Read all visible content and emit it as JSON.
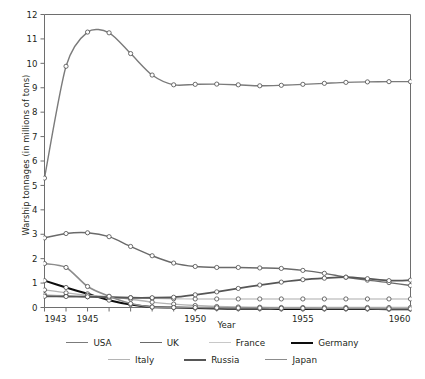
{
  "chart_data": {
    "type": "line",
    "title": "",
    "xlabel": "Year",
    "ylabel": "Warship tonnages (in millions of tons)",
    "xlim": [
      1943,
      1960
    ],
    "ylim": [
      0,
      12
    ],
    "ytick_step": 1,
    "yticks": [
      "0",
      "1",
      "2",
      "3",
      "4",
      "5",
      "6",
      "7",
      "8",
      "9",
      "10",
      "11",
      "12"
    ],
    "xticks_major": [
      "1943",
      "1945",
      "1950",
      "1955",
      "1960"
    ],
    "xticks_all": [
      1943,
      1944,
      1945,
      1946,
      1947,
      1948,
      1949,
      1950,
      1951,
      1952,
      1953,
      1954,
      1955,
      1956,
      1957,
      1958,
      1959,
      1960
    ],
    "grid": false,
    "marker": "open-circle",
    "legend_position": "bottom",
    "x": [
      1943,
      1944,
      1945,
      1946,
      1947,
      1948,
      1949,
      1950,
      1951,
      1952,
      1953,
      1954,
      1955,
      1956,
      1957,
      1958,
      1959,
      1960
    ],
    "series": [
      {
        "name": "USA",
        "color": "#7b7b7b",
        "width": 1.4,
        "values": [
          5.3,
          9.88,
          11.28,
          11.25,
          10.4,
          9.52,
          9.12,
          9.14,
          9.15,
          9.12,
          9.08,
          9.1,
          9.14,
          9.18,
          9.22,
          9.24,
          9.25,
          9.25
        ]
      },
      {
        "name": "UK",
        "color": "#6a6a6a",
        "width": 1.4,
        "values": [
          2.85,
          3.03,
          3.06,
          2.9,
          2.5,
          2.12,
          1.82,
          1.68,
          1.64,
          1.64,
          1.62,
          1.6,
          1.52,
          1.4,
          1.24,
          1.12,
          1.02,
          0.9
        ]
      },
      {
        "name": "France",
        "color": "#c8c8c8",
        "width": 1.4,
        "values": [
          0.52,
          0.48,
          0.44,
          0.42,
          0.4,
          0.38,
          0.36,
          0.35,
          0.35,
          0.35,
          0.35,
          0.35,
          0.35,
          0.35,
          0.35,
          0.35,
          0.35,
          0.35
        ]
      },
      {
        "name": "Germany",
        "color": "#0d0d0d",
        "width": 2.0,
        "values": [
          1.1,
          0.82,
          0.56,
          0.3,
          0.12,
          0.02,
          0.0,
          -0.02,
          -0.04,
          -0.05,
          -0.05,
          -0.06,
          -0.06,
          -0.06,
          -0.06,
          -0.06,
          -0.07,
          -0.07
        ]
      },
      {
        "name": "Italy",
        "color": "#b4b4b4",
        "width": 1.4,
        "values": [
          0.72,
          0.6,
          0.5,
          0.44,
          0.34,
          0.22,
          0.14,
          0.08,
          0.04,
          0.02,
          0.01,
          0.0,
          0.0,
          0.0,
          0.0,
          0.0,
          0.0,
          0.0
        ]
      },
      {
        "name": "Russia",
        "color": "#565656",
        "width": 1.8,
        "values": [
          0.46,
          0.45,
          0.44,
          0.42,
          0.4,
          0.4,
          0.42,
          0.52,
          0.64,
          0.78,
          0.92,
          1.04,
          1.14,
          1.2,
          1.24,
          1.18,
          1.1,
          1.12
        ]
      },
      {
        "name": "Japan",
        "color": "#8c8c8c",
        "width": 1.6,
        "values": [
          1.8,
          1.64,
          0.86,
          0.46,
          0.16,
          0.02,
          0.0,
          0.0,
          -0.01,
          -0.02,
          -0.02,
          -0.03,
          -0.03,
          -0.04,
          -0.04,
          -0.04,
          -0.05,
          -0.05
        ]
      }
    ]
  },
  "legend": {
    "rows": [
      [
        {
          "label": "USA",
          "color": "#7b7b7b",
          "width": 1.4
        },
        {
          "label": "UK",
          "color": "#6a6a6a",
          "width": 1.6
        },
        {
          "label": "France",
          "color": "#c8c8c8",
          "width": 1.4
        },
        {
          "label": "Germany",
          "color": "#0d0d0d",
          "width": 2.2
        }
      ],
      [
        {
          "label": "Italy",
          "color": "#b4b4b4",
          "width": 1.4
        },
        {
          "label": "Russia",
          "color": "#565656",
          "width": 2.0
        },
        {
          "label": "Japan",
          "color": "#8c8c8c",
          "width": 1.6
        }
      ]
    ]
  },
  "style": {
    "axis_color": "#6e6e6e",
    "text_color": "#231f20",
    "background": "#ffffff",
    "marker_fill": "#ffffff",
    "marker_stroke": "#4a4a4a"
  }
}
